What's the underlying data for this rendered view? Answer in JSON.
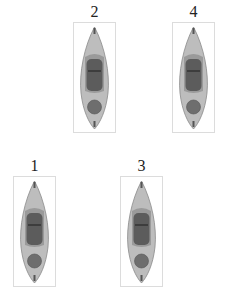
{
  "figures": [
    {
      "id": "2",
      "label": "2",
      "left": 73,
      "top": 4
    },
    {
      "id": "4",
      "label": "4",
      "left": 172,
      "top": 4
    },
    {
      "id": "1",
      "label": "1",
      "left": 13,
      "top": 158
    },
    {
      "id": "3",
      "label": "3",
      "left": 120,
      "top": 158
    }
  ],
  "figure_description": "kayak-top-view",
  "colors": {
    "hull": "#b8b8b8",
    "hull_edge": "#8a8a8a",
    "cockpit": "#5a5a5a",
    "hatch": "#6e6e6e"
  }
}
